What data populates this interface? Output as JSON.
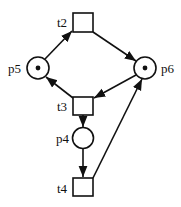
{
  "diagram": {
    "type": "petri-net",
    "stroke_color": "#111111",
    "background": "#ffffff",
    "places": [
      {
        "id": "p5",
        "label": "p5",
        "tokens": 1
      },
      {
        "id": "p6",
        "label": "p6",
        "tokens": 1
      },
      {
        "id": "p4",
        "label": "p4",
        "tokens": 0
      }
    ],
    "transitions": [
      {
        "id": "t2",
        "label": "t2"
      },
      {
        "id": "t3",
        "label": "t3"
      },
      {
        "id": "t4",
        "label": "t4"
      }
    ],
    "arcs": [
      {
        "from": "p5",
        "to": "t2"
      },
      {
        "from": "t2",
        "to": "p6"
      },
      {
        "from": "p6",
        "to": "t3"
      },
      {
        "from": "t3",
        "to": "p5"
      },
      {
        "from": "t3",
        "to": "p4"
      },
      {
        "from": "p4",
        "to": "t4"
      },
      {
        "from": "t4",
        "to": "p6"
      }
    ]
  }
}
